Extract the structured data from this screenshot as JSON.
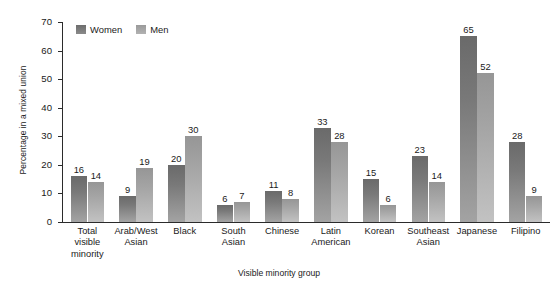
{
  "chart_data": {
    "type": "bar",
    "title": "",
    "xlabel": "Visible minority group",
    "ylabel": "Percentage in a mixed union",
    "ylim": [
      0,
      70
    ],
    "yticks": [
      0,
      10,
      20,
      30,
      40,
      50,
      60,
      70
    ],
    "grid": false,
    "legend_position": "top-left",
    "categories": [
      "Total visible minority",
      "Arab/West Asian",
      "Black",
      "South Asian",
      "Chinese",
      "Latin American",
      "Korean",
      "Southeast Asian",
      "Japanese",
      "Filipino"
    ],
    "category_lines": [
      [
        "Total",
        "visible",
        "minority"
      ],
      [
        "Arab/West",
        "Asian"
      ],
      [
        "Black"
      ],
      [
        "South",
        "Asian"
      ],
      [
        "Chinese"
      ],
      [
        "Latin",
        "American"
      ],
      [
        "Korean"
      ],
      [
        "Southeast",
        "Asian"
      ],
      [
        "Japanese"
      ],
      [
        "Filipino"
      ]
    ],
    "series": [
      {
        "name": "Women",
        "color": "#787878",
        "values": [
          16,
          9,
          20,
          6,
          11,
          33,
          15,
          23,
          65,
          28
        ]
      },
      {
        "name": "Men",
        "color": "#a6a6a6",
        "values": [
          14,
          19,
          30,
          7,
          8,
          28,
          6,
          14,
          52,
          9
        ]
      }
    ]
  },
  "legend": {
    "items": [
      {
        "label": "Women"
      },
      {
        "label": "Men"
      }
    ]
  },
  "axes": {
    "y_title": "Percentage in a mixed union",
    "x_title": "Visible minority group",
    "y_tick_labels": [
      "70",
      "60",
      "50",
      "40",
      "30",
      "20",
      "10",
      "0"
    ]
  }
}
